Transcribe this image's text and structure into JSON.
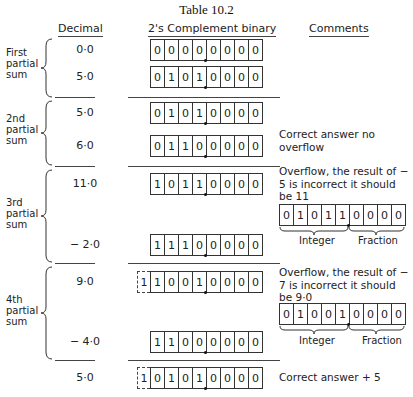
{
  "title": "Table 10.2",
  "headers": {
    "decimal": "Decimal",
    "binary": "2's Complement binary",
    "comments": "Comments"
  },
  "groups": [
    {
      "label": [
        "First",
        "partial",
        "sum"
      ]
    },
    {
      "label": [
        "2nd",
        "partial",
        "sum"
      ]
    },
    {
      "label": [
        "3rd",
        "partial",
        "sum"
      ]
    },
    {
      "label": [
        "4th",
        "partial",
        "sum"
      ]
    }
  ],
  "rows": [
    {
      "decimal": "0·0",
      "carry": null,
      "bits": [
        "0",
        "0",
        "0",
        "0",
        "0",
        "0",
        "0",
        "0"
      ]
    },
    {
      "decimal": "5·0",
      "carry": null,
      "bits": [
        "0",
        "1",
        "0",
        "1",
        "0",
        "0",
        "0",
        "0"
      ]
    },
    {
      "decimal": "5·0",
      "carry": null,
      "bits": [
        "0",
        "1",
        "0",
        "1",
        "0",
        "0",
        "0",
        "0"
      ]
    },
    {
      "decimal": "6·0",
      "carry": null,
      "bits": [
        "0",
        "1",
        "1",
        "0",
        "0",
        "0",
        "0",
        "0"
      ]
    },
    {
      "decimal": "11·0",
      "carry": null,
      "bits": [
        "1",
        "0",
        "1",
        "1",
        "0",
        "0",
        "0",
        "0"
      ]
    },
    {
      "decimal": "− 2·0",
      "carry": null,
      "bits": [
        "1",
        "1",
        "1",
        "0",
        "0",
        "0",
        "0",
        "0"
      ]
    },
    {
      "decimal": "9·0",
      "carry": "1",
      "bits": [
        "1",
        "0",
        "0",
        "1",
        "0",
        "0",
        "0",
        "0"
      ]
    },
    {
      "decimal": "− 4·0",
      "carry": null,
      "bits": [
        "1",
        "1",
        "0",
        "0",
        "0",
        "0",
        "0",
        "0"
      ]
    },
    {
      "decimal": "5·0",
      "carry": "1",
      "bits": [
        "0",
        "1",
        "0",
        "1",
        "0",
        "0",
        "0",
        "0"
      ]
    }
  ],
  "comments": {
    "c2": "Correct answer no overflow",
    "c3": "Overflow, the result of − 5 is incorrect it should be 11",
    "c3_bits": [
      "0",
      "1",
      "0",
      "1",
      "1",
      "0",
      "0",
      "0",
      "0"
    ],
    "c4": "Overflow, the result of − 7 is incorrect it should be 9·0",
    "c4_bits": [
      "0",
      "1",
      "0",
      "0",
      "1",
      "0",
      "0",
      "0",
      "0"
    ],
    "integer_label": "Integer",
    "fraction_label": "Fraction",
    "final": "Correct answer + 5"
  }
}
